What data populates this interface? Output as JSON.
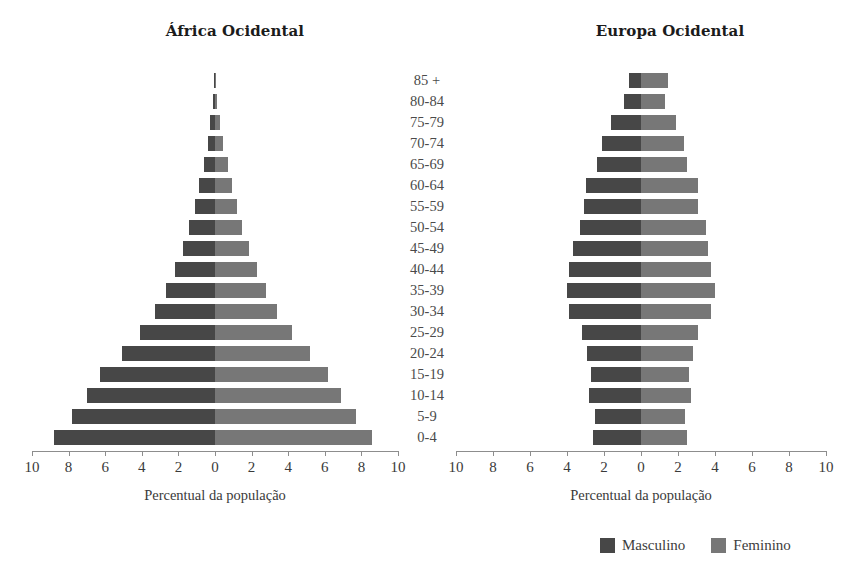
{
  "chart_data": {
    "type": "bar",
    "subtype": "population-pyramid",
    "xlabel": "Percentual da população",
    "ylabel": "",
    "xlim": [
      -10,
      10
    ],
    "xticks": [
      10,
      8,
      6,
      4,
      2,
      0,
      2,
      4,
      6,
      8,
      10
    ],
    "grid": false,
    "legend_position": "bottom-right",
    "categories": [
      "85 +",
      "80-84",
      "75-79",
      "70-74",
      "65-69",
      "60-64",
      "55-59",
      "50-54",
      "45-49",
      "40-44",
      "35-39",
      "30-34",
      "25-29",
      "20-24",
      "15-19",
      "10-14",
      "5-9",
      "0-4"
    ],
    "panels": [
      {
        "title": "África Ocidental",
        "axis_title": "Percentual da população",
        "series": [
          {
            "name": "Masculino",
            "values": [
              0.05,
              0.1,
              0.25,
              0.4,
              0.6,
              0.85,
              1.1,
              1.4,
              1.75,
              2.2,
              2.7,
              3.3,
              4.1,
              5.1,
              6.3,
              7.0,
              7.8,
              8.8
            ]
          },
          {
            "name": "Feminino",
            "values": [
              0.05,
              0.1,
              0.25,
              0.45,
              0.7,
              0.95,
              1.2,
              1.5,
              1.85,
              2.3,
              2.8,
              3.4,
              4.2,
              5.2,
              6.2,
              6.9,
              7.7,
              8.6
            ]
          }
        ]
      },
      {
        "title": "Europa Ocidental",
        "axis_title": "Percentual da população",
        "series": [
          {
            "name": "Masculino",
            "values": [
              0.65,
              0.9,
              1.6,
              2.1,
              2.4,
              3.0,
              3.1,
              3.3,
              3.7,
              3.9,
              4.0,
              3.9,
              3.2,
              2.9,
              2.7,
              2.8,
              2.5,
              2.6
            ]
          },
          {
            "name": "Feminino",
            "values": [
              1.45,
              1.3,
              1.9,
              2.3,
              2.5,
              3.1,
              3.1,
              3.5,
              3.6,
              3.8,
              4.0,
              3.8,
              3.1,
              2.8,
              2.6,
              2.7,
              2.4,
              2.5
            ]
          }
        ]
      }
    ],
    "legend": [
      {
        "label": "Masculino",
        "color": "#474747"
      },
      {
        "label": "Feminino",
        "color": "#777777"
      }
    ]
  }
}
